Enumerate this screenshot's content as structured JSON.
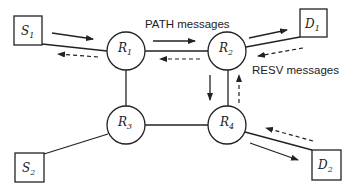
{
  "diagram": {
    "title": "",
    "colors": {
      "stroke": "#222222",
      "background": "#ffffff"
    },
    "nodes": [
      {
        "id": "S1",
        "shape": "square",
        "label": "S",
        "sub": "1"
      },
      {
        "id": "S2",
        "shape": "square",
        "label": "S",
        "sub": "2"
      },
      {
        "id": "D1",
        "shape": "square",
        "label": "D",
        "sub": "1"
      },
      {
        "id": "D2",
        "shape": "square",
        "label": "D",
        "sub": "2"
      },
      {
        "id": "R1",
        "shape": "circle",
        "label": "R",
        "sub": "1"
      },
      {
        "id": "R2",
        "shape": "circle",
        "label": "R",
        "sub": "2"
      },
      {
        "id": "R3",
        "shape": "circle",
        "label": "R",
        "sub": "3"
      },
      {
        "id": "R4",
        "shape": "circle",
        "label": "R",
        "sub": "4"
      }
    ],
    "links": [
      [
        "S1",
        "R1"
      ],
      [
        "R1",
        "R2"
      ],
      [
        "R2",
        "D1"
      ],
      [
        "R1",
        "R3"
      ],
      [
        "R3",
        "R4"
      ],
      [
        "R2",
        "R4"
      ],
      [
        "R3",
        "S2"
      ],
      [
        "R4",
        "D2"
      ]
    ],
    "labels": {
      "path": "PATH messages",
      "resv": "RESV messages"
    },
    "legend": {
      "solid_arrow": "PATH messages",
      "dashed_arrow": "RESV messages"
    }
  }
}
